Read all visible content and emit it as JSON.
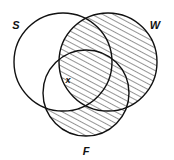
{
  "figure": {
    "type": "venn-diagram",
    "set_count": 3,
    "background_color": "#ffffff",
    "stroke_color": "#111111"
  },
  "labels": {
    "set_s": "S",
    "set_w": "W",
    "set_f": "F",
    "region_x": "x"
  },
  "circles": {
    "s": {
      "cx": 63,
      "cy": 62,
      "r": 49
    },
    "w": {
      "cx": 108,
      "cy": 62,
      "r": 49
    },
    "f": {
      "cx": 86,
      "cy": 93,
      "r": 43
    }
  },
  "label_positions": {
    "set_s": {
      "x": 16,
      "y": 26
    },
    "set_w": {
      "x": 155,
      "y": 26
    },
    "set_f": {
      "x": 86,
      "y": 152
    },
    "region_x": {
      "x": 68,
      "y": 81
    }
  },
  "shading": {
    "pattern": "diagonal-hatch",
    "direction": "lower-left-to-upper-right",
    "spacing_px": 5,
    "color": "#111111",
    "shaded_description": "F minus (S intersect F outside W)"
  }
}
